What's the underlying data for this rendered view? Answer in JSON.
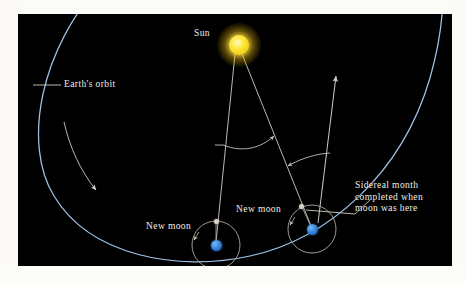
{
  "figure": {
    "type": "astronomy-diagram",
    "topic": "Sidereal month versus synodic month",
    "background_color": "#000000",
    "page_color": "#fdfdfb"
  },
  "labels": {
    "sun": "Sun",
    "earths_orbit": "Earth's orbit",
    "new_moon_left": "New moon",
    "new_moon_right": "New moon",
    "sidereal_note": "Sidereal month completed when moon was here"
  },
  "sidereal_note_lines": [
    "Sidereal month",
    "completed when",
    "moon was here"
  ],
  "bodies": {
    "sun": {
      "name": "Sun",
      "color": "#ffe839",
      "glow_color": "#fff07a",
      "x": 221,
      "y": 31,
      "radius": 10
    },
    "earth_left": {
      "name": "Earth at first new moon",
      "color": "#3a8fe0",
      "x": 198,
      "y": 231,
      "radius": 5.5
    },
    "earth_right": {
      "name": "Earth one sidereal month later",
      "color": "#3a8fe0",
      "x": 294,
      "y": 215,
      "radius": 5.5
    },
    "moon_left": {
      "name": "Moon at first new moon",
      "color": "#d8d2c6",
      "x": 198,
      "y": 207,
      "radius": 2.5
    },
    "moon_right": {
      "name": "Moon after one sidereal month",
      "color": "#d8d2c6",
      "x": 283,
      "y": 192,
      "radius": 2.5
    }
  },
  "orbits": {
    "earth_orbit": {
      "name": "Earth's orbit around the Sun",
      "color": "#9fc3e8",
      "stroke_width": 1.2
    },
    "moon_orbit_left": {
      "name": "Moon's orbit at first position",
      "color": "#b9b2a6",
      "radius": 24,
      "stroke_width": 0.9
    },
    "moon_orbit_right": {
      "name": "Moon's orbit one month later",
      "color": "#b9b2a6",
      "radius": 24,
      "stroke_width": 0.9
    }
  },
  "annotations": {
    "sun_ray_left": {
      "name": "Sun to first Earth sight line",
      "color": "#cfcac0"
    },
    "sun_ray_right": {
      "name": "Sun to second Earth sight line",
      "color": "#cfcac0"
    },
    "star_direction_arrow": {
      "name": "Direction to distant star",
      "color": "#cfcac0"
    },
    "angle_arc_left": {
      "name": "Angle swept by Earth around Sun",
      "color": "#cfcac0"
    },
    "angle_arc_right": {
      "name": "Extra angle for synodic month",
      "color": "#cfcac0"
    },
    "orbit_direction_arrow": {
      "name": "Earth orbital direction (counterclockwise)",
      "color": "#cfcac0"
    },
    "leader_earths_orbit": {
      "name": "Leader line to Earth's orbit",
      "color": "#d6d1c6"
    },
    "leader_sidereal": {
      "name": "Leader line to moon position",
      "color": "#d6d1c6"
    }
  }
}
